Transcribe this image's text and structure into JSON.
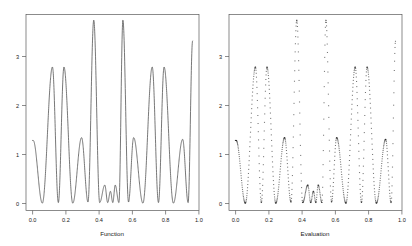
{
  "figure": {
    "panel_count": 2,
    "background_color": "#ffffff",
    "line_color": "#4a4a4a",
    "point_color": "#1f1f1f"
  },
  "chart_data": [
    {
      "type": "line",
      "title": "",
      "xlabel": "Function",
      "ylabel": "",
      "xlim": [
        -0.04,
        1.04
      ],
      "ylim": [
        -0.12,
        3.35
      ],
      "xticks": [
        0.0,
        0.2,
        0.4,
        0.6,
        0.8,
        1.0
      ],
      "xticklabels": [
        "0.0",
        "0.2",
        "0.4",
        "0.6",
        "0.8",
        "1.0"
      ],
      "yticks": [
        0,
        1,
        2,
        3
      ],
      "yticklabels": [
        "0",
        "1",
        "2",
        "3"
      ],
      "grid": false,
      "legend": "none",
      "series": [
        {
          "name": "function",
          "style": "continuous-line",
          "peaks_x": [
            0.005,
            0.125,
            0.197,
            0.307,
            0.383,
            0.452,
            0.487,
            0.517,
            0.565,
            0.632,
            0.748,
            0.822,
            0.938,
            1.0
          ],
          "peaks_y": [
            1.12,
            2.42,
            2.42,
            1.17,
            3.25,
            0.33,
            0.22,
            0.33,
            3.25,
            1.17,
            2.42,
            2.42,
            1.14,
            2.88
          ],
          "troughs_x": [
            0.062,
            0.162,
            0.252,
            0.347,
            0.42,
            0.47,
            0.502,
            0.54,
            0.6,
            0.69,
            0.787,
            0.88,
            0.972
          ],
          "troughs_y": [
            0.01,
            0.02,
            0.01,
            0.03,
            0.02,
            0.02,
            0.02,
            0.02,
            0.03,
            0.01,
            0.02,
            0.01,
            0.02
          ]
        }
      ]
    },
    {
      "type": "scatter",
      "title": "",
      "xlabel": "Evaluation",
      "ylabel": "",
      "xlim": [
        -0.04,
        1.04
      ],
      "ylim": [
        -0.12,
        3.35
      ],
      "xticks": [
        0.0,
        0.2,
        0.4,
        0.6,
        0.8,
        1.0
      ],
      "xticklabels": [
        "0.0",
        "0.2",
        "0.4",
        "0.6",
        "0.8",
        "1.0"
      ],
      "yticks": [
        0,
        1,
        2,
        3
      ],
      "yticklabels": [
        "0",
        "1",
        "2",
        "3"
      ],
      "grid": false,
      "legend": "none",
      "series": [
        {
          "name": "evaluation",
          "style": "dense-point-markers",
          "marker": "small-dash",
          "peaks_x": [
            0.005,
            0.125,
            0.197,
            0.307,
            0.383,
            0.452,
            0.487,
            0.517,
            0.565,
            0.632,
            0.748,
            0.822,
            0.938,
            1.0
          ],
          "peaks_y": [
            1.12,
            2.42,
            2.42,
            1.17,
            3.25,
            0.33,
            0.22,
            0.33,
            3.25,
            1.17,
            2.42,
            2.42,
            1.14,
            2.88
          ]
        }
      ]
    }
  ],
  "panels": [
    {
      "id": "function-panel",
      "axis_title": "Function",
      "x_tick_labels": [
        "0.0",
        "0.2",
        "0.4",
        "0.6",
        "0.8",
        "1.0"
      ],
      "y_tick_labels": [
        "0",
        "1",
        "2",
        "3"
      ]
    },
    {
      "id": "evaluation-panel",
      "axis_title": "Evaluation",
      "x_tick_labels": [
        "0.0",
        "0.2",
        "0.4",
        "0.6",
        "0.8",
        "1.0"
      ],
      "y_tick_labels": [
        "0",
        "1",
        "2",
        "3"
      ]
    }
  ]
}
